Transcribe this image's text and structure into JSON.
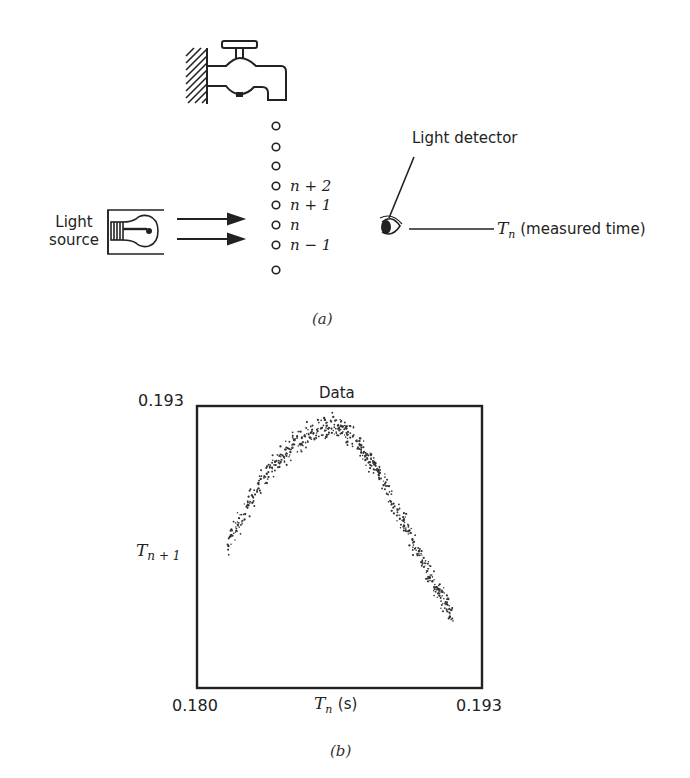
{
  "figure_a": {
    "caption": "(a)",
    "light_source_label_line1": "Light",
    "light_source_label_line2": "source",
    "light_detector_label": "Light detector",
    "measured_time_symbol": "T",
    "measured_time_subscript": "n",
    "measured_time_text": "(measured time)",
    "drop_labels": [
      "n + 2",
      "n + 1",
      "n",
      "n − 1"
    ],
    "drop_count": 8,
    "icons": [
      "faucet-icon",
      "wall-hatch-icon",
      "light-bulb-icon",
      "arrow-icon",
      "eye-icon"
    ]
  },
  "figure_b": {
    "caption": "(b)",
    "title": "Data",
    "x_min_label": "0.180",
    "x_max_label": "0.193",
    "y_max_label": "0.193",
    "x_axis_symbol": "T",
    "x_axis_subscript": "n",
    "x_axis_unit": "(s)",
    "y_axis_symbol": "T",
    "y_axis_subscript": "n + 1"
  },
  "chart_data": {
    "type": "scatter",
    "title": "Data",
    "xlabel": "T_n (s)",
    "ylabel": "T_{n+1}",
    "xlim": [
      0.18,
      0.193
    ],
    "ylim": [
      0.18,
      0.193
    ],
    "grid": false,
    "legend": null,
    "series": [
      {
        "name": "Data",
        "envelope_x": [
          0.1814,
          0.182,
          0.183,
          0.184,
          0.185,
          0.186,
          0.1865,
          0.187,
          0.188,
          0.189,
          0.19,
          0.191,
          0.1917
        ],
        "envelope_y_center": [
          0.1866,
          0.1878,
          0.1896,
          0.1908,
          0.1916,
          0.192,
          0.192,
          0.1917,
          0.1904,
          0.1885,
          0.1865,
          0.1845,
          0.1832
        ],
        "band_halfwidth": 0.0008,
        "approx_point_count": 600
      }
    ]
  }
}
